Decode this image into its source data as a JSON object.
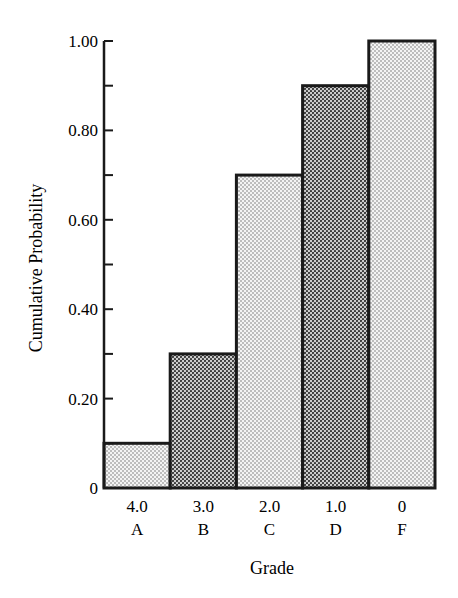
{
  "chart_data": {
    "type": "bar",
    "title": "",
    "xlabel": "Grade",
    "ylabel": "Cumulative Probability",
    "categories": [
      "A",
      "B",
      "C",
      "D",
      "F"
    ],
    "category_values": [
      "4.0",
      "3.0",
      "2.0",
      "1.0",
      "0"
    ],
    "values": [
      0.1,
      0.3,
      0.7,
      0.9,
      1.0
    ],
    "ylim": [
      0,
      1.0
    ],
    "yticks": [
      "0",
      "0.20",
      "0.40",
      "0.60",
      "0.80",
      "1.00"
    ],
    "minor_ticks_step": 0.1,
    "bar_fills": [
      "light-dots",
      "dark-dots",
      "light-dots",
      "dark-dots",
      "light-dots"
    ],
    "grid": false,
    "legend": null
  },
  "labels": {
    "y_axis_title": "Cumulative Probability",
    "x_axis_title": "Grade"
  }
}
